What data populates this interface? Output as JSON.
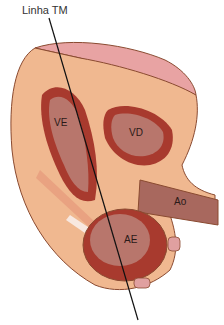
{
  "title": "Linha TM",
  "labels": {
    "left_ventricle": "VE",
    "right_ventricle": "VD",
    "aorta": "Ao",
    "left_atrium": "AE"
  },
  "colors": {
    "myocardium": "#f0b890",
    "chamber_wall": "#a83a2e",
    "chamber_inner": "#b8766c",
    "pericardium": "#e8a0a0",
    "outline": "#8a4a30",
    "line": "#111111",
    "aorta": "#a8685e"
  }
}
